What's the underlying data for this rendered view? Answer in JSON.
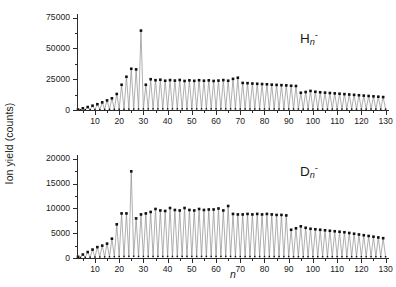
{
  "figure": {
    "ylabel": "Ion yield (counts)",
    "xlabel": "n",
    "background": "#ffffff",
    "line_color": "#8c8c8c",
    "marker_color": "#111111",
    "axis_color": "#2b2b2b"
  },
  "panels": [
    {
      "id": "top",
      "species_symbol": "H",
      "species_sub": "n",
      "species_sup": "-",
      "ylim": [
        0,
        78000
      ],
      "yticks": [
        0,
        25000,
        50000,
        75000
      ],
      "ytick_labels": [
        "0",
        "25000",
        "50000",
        "75000"
      ],
      "yminor": [
        12500,
        37500,
        62500
      ],
      "xlim": [
        3,
        131
      ],
      "xticks": [
        10,
        20,
        30,
        40,
        50,
        60,
        70,
        80,
        90,
        100,
        110,
        120,
        130
      ],
      "xtick_labels": [
        "10",
        "20",
        "30",
        "40",
        "50",
        "60",
        "70",
        "80",
        "90",
        "100",
        "110",
        "120",
        "130"
      ],
      "xminor": [
        5,
        15,
        25,
        35,
        45,
        55,
        65,
        75,
        85,
        95,
        105,
        115,
        125
      ]
    },
    {
      "id": "bottom",
      "species_symbol": "D",
      "species_sub": "n",
      "species_sup": "-",
      "ylim": [
        0,
        20800
      ],
      "yticks": [
        0,
        5000,
        10000,
        15000,
        20000
      ],
      "ytick_labels": [
        "0",
        "5000",
        "10000",
        "15000",
        "20000"
      ],
      "yminor": [
        2500,
        7500,
        12500,
        17500
      ],
      "xlim": [
        3,
        131
      ],
      "xticks": [
        10,
        20,
        30,
        40,
        50,
        60,
        70,
        80,
        90,
        100,
        110,
        120,
        130
      ],
      "xtick_labels": [
        "10",
        "20",
        "30",
        "40",
        "50",
        "60",
        "70",
        "80",
        "90",
        "100",
        "110",
        "120",
        "130"
      ],
      "xminor": [
        5,
        15,
        25,
        35,
        45,
        55,
        65,
        75,
        85,
        95,
        105,
        115,
        125
      ]
    }
  ],
  "chart_data": [
    {
      "type": "line",
      "panel": "top",
      "title": "",
      "series_name": "H_n^-",
      "xlabel": "n",
      "ylabel": "Ion yield (counts)",
      "xlim": [
        3,
        131
      ],
      "ylim": [
        0,
        78000
      ],
      "grid": false,
      "legend": "none",
      "annotation": "H n -",
      "x": [
        3,
        4,
        5,
        6,
        7,
        8,
        9,
        10,
        11,
        12,
        13,
        14,
        15,
        16,
        17,
        18,
        19,
        20,
        21,
        22,
        23,
        24,
        25,
        26,
        27,
        28,
        29,
        30,
        31,
        32,
        33,
        34,
        35,
        36,
        37,
        38,
        39,
        40,
        41,
        42,
        43,
        44,
        45,
        46,
        47,
        48,
        49,
        50,
        51,
        52,
        53,
        54,
        55,
        56,
        57,
        58,
        59,
        60,
        61,
        62,
        63,
        64,
        65,
        66,
        67,
        68,
        69,
        70,
        71,
        72,
        73,
        74,
        75,
        76,
        77,
        78,
        79,
        80,
        81,
        82,
        83,
        84,
        85,
        86,
        87,
        88,
        89,
        90,
        91,
        92,
        93,
        94,
        95,
        96,
        97,
        98,
        99,
        100,
        101,
        102,
        103,
        104,
        105,
        106,
        107,
        108,
        109,
        110,
        111,
        112,
        113,
        114,
        115,
        116,
        117,
        118,
        119,
        120,
        121,
        122,
        123,
        124,
        125,
        126,
        127,
        128,
        129,
        130
      ],
      "y": [
        400,
        200,
        1400,
        250,
        2400,
        300,
        3500,
        350,
        4700,
        400,
        6200,
        450,
        7800,
        500,
        9500,
        550,
        13000,
        600,
        20500,
        650,
        27000,
        700,
        33500,
        750,
        33000,
        800,
        64500,
        850,
        20500,
        900,
        25000,
        900,
        24200,
        900,
        24600,
        900,
        23800,
        900,
        24300,
        900,
        23900,
        900,
        24400,
        900,
        23600,
        900,
        24100,
        900,
        23700,
        900,
        24200,
        900,
        23800,
        900,
        24100,
        900,
        23600,
        900,
        23900,
        900,
        24300,
        900,
        23800,
        900,
        25300,
        900,
        26200,
        800,
        22000,
        800,
        21800,
        800,
        21500,
        800,
        21300,
        800,
        21100,
        800,
        20900,
        800,
        20600,
        800,
        20400,
        800,
        20200,
        800,
        20000,
        800,
        19700,
        800,
        19500,
        800,
        14000,
        700,
        14600,
        700,
        15500,
        700,
        14800,
        700,
        14400,
        700,
        14100,
        700,
        13800,
        700,
        13500,
        700,
        13200,
        700,
        12900,
        700,
        12600,
        700,
        12300,
        700,
        12000,
        700,
        11700,
        700,
        11400,
        700,
        11100,
        700,
        10800,
        700,
        10500,
        700,
        10200,
        700,
        9900,
        700
      ]
    },
    {
      "type": "line",
      "panel": "bottom",
      "title": "",
      "series_name": "D_n^-",
      "xlabel": "n",
      "ylabel": "Ion yield (counts)",
      "xlim": [
        3,
        131
      ],
      "ylim": [
        0,
        20800
      ],
      "grid": false,
      "legend": "none",
      "annotation": "D n -",
      "x": [
        3,
        4,
        5,
        6,
        7,
        8,
        9,
        10,
        11,
        12,
        13,
        14,
        15,
        16,
        17,
        18,
        19,
        20,
        21,
        22,
        23,
        24,
        25,
        26,
        27,
        28,
        29,
        30,
        31,
        32,
        33,
        34,
        35,
        36,
        37,
        38,
        39,
        40,
        41,
        42,
        43,
        44,
        45,
        46,
        47,
        48,
        49,
        50,
        51,
        52,
        53,
        54,
        55,
        56,
        57,
        58,
        59,
        60,
        61,
        62,
        63,
        64,
        65,
        66,
        67,
        68,
        69,
        70,
        71,
        72,
        73,
        74,
        75,
        76,
        77,
        78,
        79,
        80,
        81,
        82,
        83,
        84,
        85,
        86,
        87,
        88,
        89,
        90,
        91,
        92,
        93,
        94,
        95,
        96,
        97,
        98,
        99,
        100,
        101,
        102,
        103,
        104,
        105,
        106,
        107,
        108,
        109,
        110,
        111,
        112,
        113,
        114,
        115,
        116,
        117,
        118,
        119,
        120,
        121,
        122,
        123,
        124,
        125,
        126,
        127,
        128,
        129,
        130
      ],
      "y": [
        250,
        120,
        700,
        140,
        1200,
        160,
        1700,
        180,
        2200,
        200,
        2500,
        220,
        2900,
        240,
        3900,
        260,
        6800,
        280,
        9000,
        300,
        9000,
        320,
        17500,
        340,
        8000,
        300,
        8800,
        300,
        9000,
        300,
        9300,
        300,
        9900,
        300,
        9600,
        300,
        9500,
        300,
        10100,
        300,
        9700,
        300,
        9600,
        300,
        10100,
        300,
        9700,
        300,
        9600,
        300,
        9900,
        300,
        9700,
        300,
        9800,
        300,
        9800,
        300,
        10000,
        300,
        9600,
        300,
        10500,
        300,
        8900,
        280,
        8800,
        280,
        8800,
        280,
        8900,
        280,
        8800,
        280,
        8900,
        280,
        8800,
        280,
        8900,
        280,
        8800,
        280,
        8700,
        280,
        8700,
        280,
        8600,
        280,
        5700,
        260,
        6000,
        260,
        6400,
        260,
        6100,
        260,
        5900,
        260,
        5800,
        260,
        5700,
        260,
        5600,
        260,
        5500,
        260,
        5400,
        260,
        5300,
        260,
        5200,
        260,
        5050,
        260,
        4900,
        260,
        4750,
        260,
        4600,
        260,
        4450,
        260,
        4300,
        260,
        4150,
        260,
        4000,
        260
      ]
    }
  ]
}
